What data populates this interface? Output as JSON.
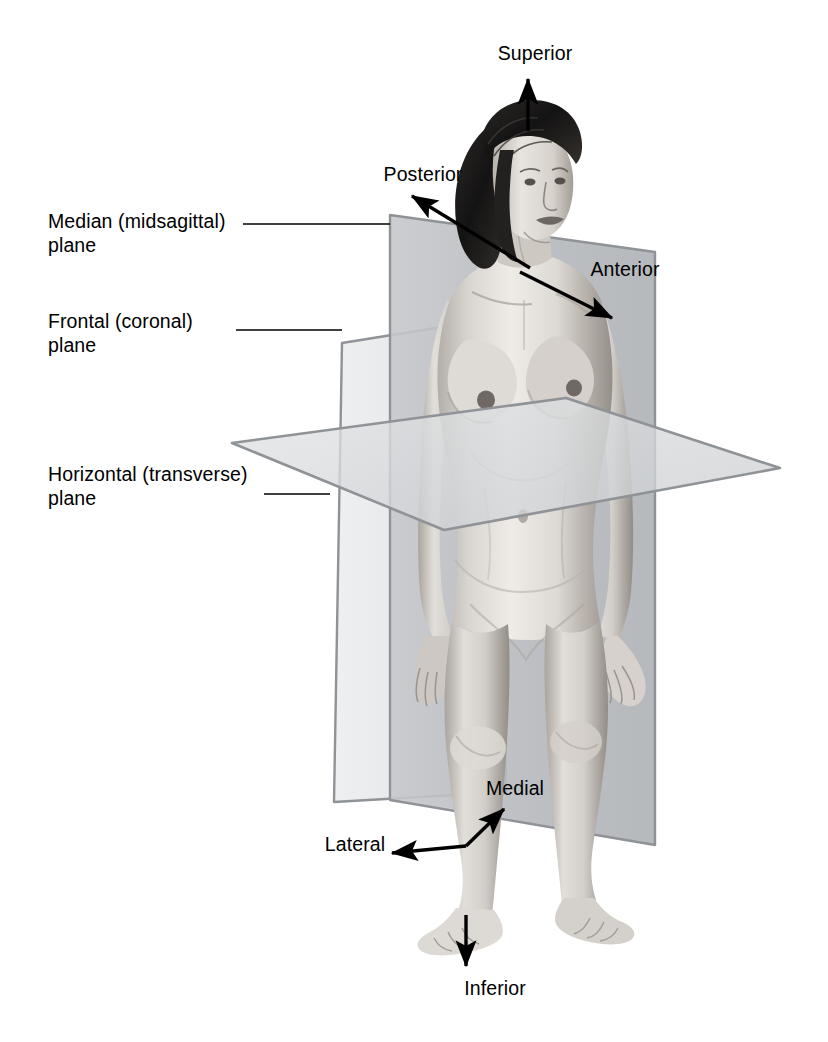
{
  "plane_labels": [
    {
      "id": "median",
      "text": "Median (midsagittal)\nplane",
      "leader": "horizontal line to median plane top-left corner"
    },
    {
      "id": "frontal",
      "text": "Frontal (coronal)\nplane",
      "leader": "horizontal line to frontal plane top-left corner"
    },
    {
      "id": "horizontal",
      "text": "Horizontal (transverse)\nplane",
      "leader": "horizontal line to horizontal plane left edge"
    }
  ],
  "direction_labels": [
    {
      "id": "superior",
      "text": "Superior",
      "arrow": "up"
    },
    {
      "id": "posterior",
      "text": "Posterior",
      "arrow": "up-left"
    },
    {
      "id": "anterior",
      "text": "Anterior",
      "arrow": "down-right"
    },
    {
      "id": "medial",
      "text": "Medial",
      "arrow": "up-right"
    },
    {
      "id": "lateral",
      "text": "Lateral",
      "arrow": "down-left"
    },
    {
      "id": "inferior",
      "text": "Inferior",
      "arrow": "down"
    }
  ],
  "colors": {
    "background": "#ffffff",
    "text": "#000000",
    "arrow": "#000000",
    "plane_edge": "#8f9296",
    "median_plane_fill": "#b9bcc0",
    "frontal_plane_fill": "#e4e6e8",
    "horizontal_plane_fill": "#d6d8da",
    "skin_light": "#e9e6e2",
    "skin_mid": "#c9c4bf",
    "skin_shadow": "#9a948e",
    "hair": "#1d1c1c"
  }
}
